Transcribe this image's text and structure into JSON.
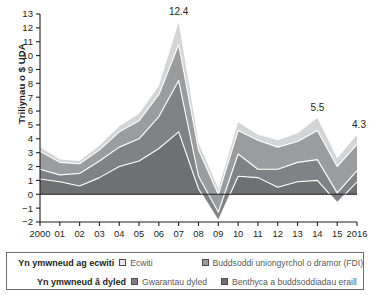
{
  "chart_data": {
    "type": "area",
    "stacked": true,
    "title": "",
    "xlabel": "",
    "ylabel": "Triliynau o $ UDA",
    "x": [
      2000,
      2001,
      2002,
      2003,
      2004,
      2005,
      2006,
      2007,
      2008,
      2009,
      2010,
      2011,
      2012,
      2013,
      2014,
      2015,
      2016
    ],
    "tick_labels_x": [
      "2000",
      "01",
      "02",
      "03",
      "04",
      "05",
      "06",
      "07",
      "08",
      "09",
      "10",
      "11",
      "12",
      "13",
      "14",
      "15",
      "2016"
    ],
    "tick_labels_y": [
      "-2",
      "-1",
      "0",
      "1",
      "2",
      "3",
      "4",
      "5",
      "6",
      "7",
      "8",
      "9",
      "10",
      "11",
      "12",
      "13"
    ],
    "ylim": [
      -2,
      13
    ],
    "grid": false,
    "legend_position": "bottom",
    "series": [
      {
        "name": "Benthyca a buddsoddiadau eraill",
        "group": "Yn ymwneud â dyled",
        "color": "#6f7072",
        "values": [
          1.1,
          0.9,
          0.6,
          1.2,
          2.0,
          2.4,
          3.3,
          4.5,
          0.4,
          -1.9,
          1.3,
          1.2,
          0.5,
          0.9,
          1.0,
          -0.6,
          0.9
        ]
      },
      {
        "name": "Gwarantau dyled",
        "group": "Yn ymwneud â dyled",
        "color": "#808285",
        "values": [
          0.7,
          0.5,
          0.9,
          1.2,
          1.4,
          1.6,
          2.3,
          3.7,
          0.9,
          0.6,
          1.6,
          0.6,
          1.3,
          1.4,
          1.5,
          0.7,
          0.8
        ]
      },
      {
        "name": "Buddsoddi uniongyrchol o dramor (FDI)",
        "group": "Yn ymwneud ag ecwiti",
        "color": "#9a9c9e",
        "values": [
          1.3,
          0.9,
          0.7,
          0.8,
          1.1,
          1.3,
          1.6,
          2.6,
          1.9,
          1.3,
          1.7,
          2.1,
          1.6,
          1.5,
          2.1,
          1.9,
          1.9
        ]
      },
      {
        "name": "Ecwiti",
        "group": "Yn ymwneud ag ecwiti",
        "color": "#d4d5d7",
        "values": [
          0.3,
          0.2,
          0.2,
          0.3,
          0.4,
          0.5,
          0.6,
          1.6,
          0.5,
          0.4,
          0.6,
          0.4,
          0.5,
          0.6,
          0.9,
          0.6,
          0.7
        ]
      }
    ],
    "totals": [
      3.4,
      2.5,
      2.4,
      3.5,
      4.9,
      5.8,
      7.8,
      12.4,
      3.7,
      0.4,
      5.2,
      4.3,
      3.9,
      4.4,
      5.5,
      2.6,
      4.3
    ],
    "annotations": [
      {
        "label": "12.4",
        "x": 2007,
        "y": 12.4
      },
      {
        "label": "5.5",
        "x": 2014,
        "y": 5.5
      },
      {
        "label": "4.3",
        "x": 2016,
        "y": 4.3
      }
    ]
  },
  "axis": {
    "y_title": "Triliynau o $ UDA"
  },
  "legend": {
    "group_equity_label": "Yn ymwneud ag ecwiti",
    "group_debt_label": "Yn ymwneud â dyled",
    "items": [
      {
        "label": "Ecwiti",
        "color": "#e6e7e8"
      },
      {
        "label": "Buddsoddi uniongyrchol o dramor (FDI)",
        "color": "#9a9c9e"
      },
      {
        "label": "Gwarantau dyled",
        "color": "#808285"
      },
      {
        "label": "Benthyca a buddsoddiadau eraill",
        "color": "#6f7072"
      }
    ]
  }
}
